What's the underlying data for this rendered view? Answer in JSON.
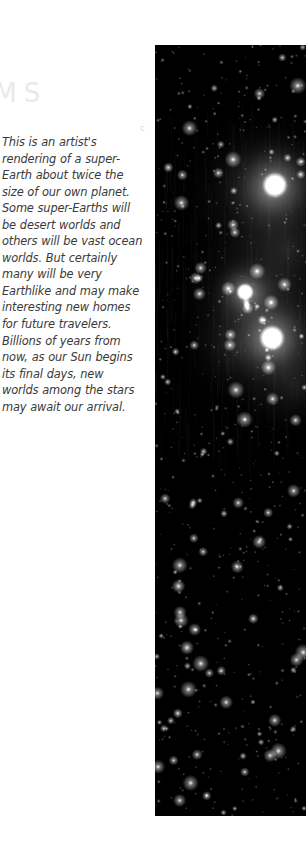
{
  "page": {
    "background_color": "#ffffff",
    "width": 306,
    "height": 861
  },
  "text_column": {
    "heading": {
      "visible_text": "TEMS",
      "note_clipped": "clipped at left viewport edge",
      "color": "#e9e9e9"
    },
    "corner_mark": {
      "glyph": "c",
      "color": "#d8d8d8"
    },
    "body_paragraph": "This is an artist's rendering of a super-Earth about twice the size of our own planet. Some super-Earths will be desert worlds and others will be vast ocean worlds. But certainly many will be very Earthlike and may make interesting new homes for future travelers. Billions of years from now, as our Sun begins its final days, new worlds among the stars may await our arrival.",
    "body_lines": [
      "This is an artist's",
      "rendering of a super-",
      "Earth about twice the",
      "size of our own planet.",
      "Some super-Earths will",
      "be desert worlds and",
      "others will be vast ocean",
      "worlds. But certainly",
      "many will be very",
      "Earthlike and may make",
      "interesting new homes",
      "for future travelers.",
      "Billions of years from",
      "now, as our Sun begins",
      "its final days, new",
      "worlds among the stars",
      "may await our arrival."
    ],
    "body_text_color": "#3a3a3a"
  },
  "figure": {
    "name": "starfield-image",
    "alt": "Dense starfield with three bright glowing stars in diffuse nebulosity",
    "background_color": "#000000",
    "bounds": {
      "left": 155,
      "top": 45,
      "width": 151,
      "height": 771
    },
    "bright_objects": [
      {
        "label": "star-upper",
        "cx": 120,
        "cy": 140,
        "radius": 13,
        "halo": 58,
        "brightness": 1.0
      },
      {
        "label": "star-middle",
        "cx": 90,
        "cy": 247,
        "radius": 9,
        "halo": 40,
        "brightness": 0.92
      },
      {
        "label": "star-lower",
        "cx": 117,
        "cy": 293,
        "radius": 13,
        "halo": 52,
        "brightness": 1.0
      }
    ],
    "nebula_glow_color": "#8a8a8a",
    "star_color": "#ffffff",
    "star_count": 620
  }
}
